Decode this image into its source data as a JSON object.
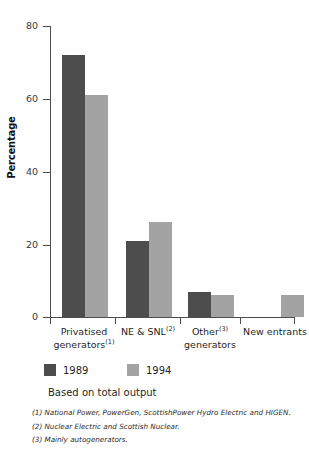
{
  "chart_data": {
    "type": "bar",
    "title": "",
    "xlabel": "",
    "ylabel": "Percentage",
    "ylim": [
      0,
      80
    ],
    "yticks": [
      0,
      20,
      40,
      60,
      80
    ],
    "ytick_labels": [
      "0",
      "20",
      "40",
      "60",
      "80"
    ],
    "grid": false,
    "legend_position": "below-axis-left",
    "categories": [
      "Privatised generators(1)",
      "NE & SNL(2)",
      "Other(3) generators",
      "New entrants"
    ],
    "category_parts": [
      {
        "line1": "Privatised",
        "line2": "generators",
        "sup": "(1)",
        "sup_on": "line2"
      },
      {
        "line1": "NE & SNL",
        "line2": "",
        "sup": "(2)",
        "sup_on": "line1"
      },
      {
        "line1": "Other",
        "line2": "generators",
        "sup": "(3)",
        "sup_on": "line1"
      },
      {
        "line1": "New entrants",
        "line2": "",
        "sup": "",
        "sup_on": ""
      }
    ],
    "series": [
      {
        "name": "1989",
        "color": "#4d4d4d",
        "values": [
          72,
          21,
          7,
          0
        ]
      },
      {
        "name": "1994",
        "color": "#a3a3a3",
        "values": [
          61,
          26,
          6,
          6
        ]
      }
    ],
    "note": "Based on total output",
    "footnotes": [
      "(1) National Power, PowerGen, ScottishPower Hydro Electric and HIGEN.",
      "(2) Nuclear Electric and Scottish Nuclear.",
      "(3) Mainly autogenerators."
    ]
  },
  "legend": {
    "items": [
      {
        "label": "1989",
        "color": "#4d4d4d"
      },
      {
        "label": "1994",
        "color": "#a3a3a3"
      }
    ]
  },
  "axis": {
    "y_title": "Percentage",
    "y_tick_0": "0",
    "y_tick_20": "20",
    "y_tick_40": "40",
    "y_tick_60": "60",
    "y_tick_80": "80"
  },
  "labels": {
    "cat1_line1": "Privatised",
    "cat1_line2": "generators",
    "cat1_sup": "(1)",
    "cat2_line1": "NE & SNL",
    "cat2_sup": "(2)",
    "cat3_line1": "Other",
    "cat3_sup": "(3)",
    "cat3_line2": "generators",
    "cat4_line1": "New entrants"
  },
  "notes": {
    "basis": "Based on total output",
    "fn1": "(1) National Power, PowerGen, ScottishPower Hydro Electric and HIGEN.",
    "fn2": "(2) Nuclear Electric and Scottish Nuclear.",
    "fn3": "(3) Mainly autogenerators."
  }
}
